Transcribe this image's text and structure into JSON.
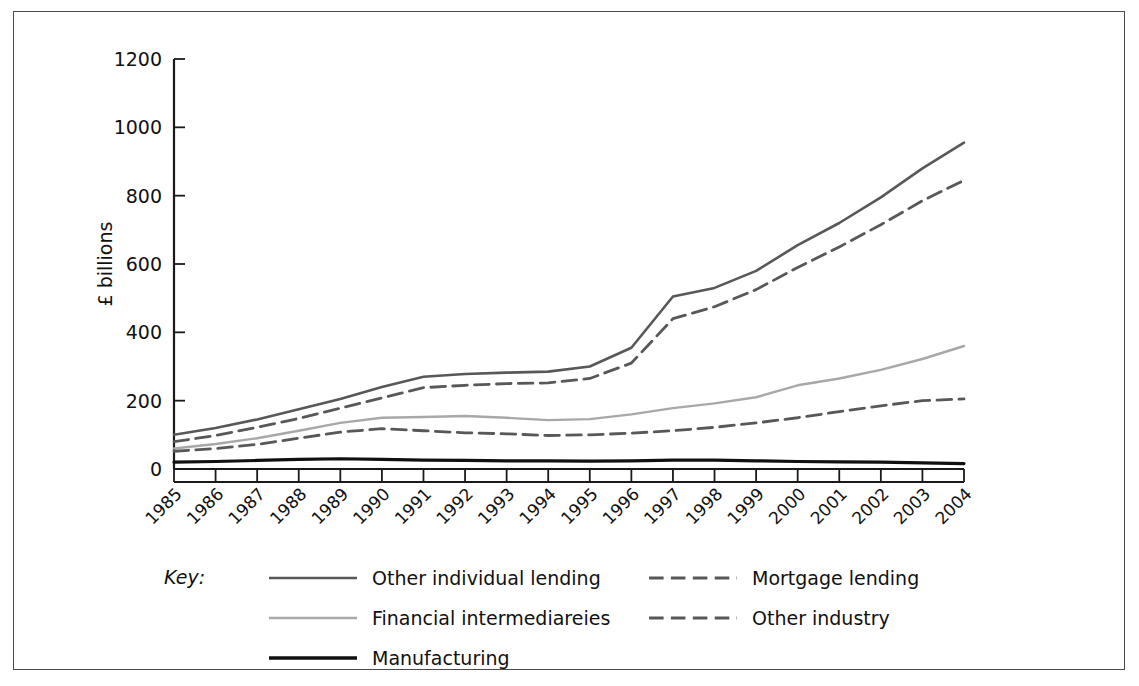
{
  "chart_data": {
    "type": "line",
    "title": "",
    "xlabel": "",
    "ylabel": "£ billions",
    "ylim": [
      0,
      1200
    ],
    "yticks": [
      0,
      200,
      400,
      600,
      800,
      1000,
      1200
    ],
    "ytick_labels": [
      "0",
      "200",
      "400",
      "600",
      "800",
      "1000",
      "1200"
    ],
    "grid": false,
    "legend_position": "below-axes",
    "legend_title": "Key:",
    "categories": [
      "1985",
      "1986",
      "1987",
      "1988",
      "1989",
      "1990",
      "1991",
      "1992",
      "1993",
      "1994",
      "1995",
      "1996",
      "1997",
      "1998",
      "1999",
      "2000",
      "2001",
      "2002",
      "2003",
      "2004"
    ],
    "series": [
      {
        "name": "Other individual lending",
        "color": "#585858",
        "style": "solid",
        "width": 2.6,
        "values": [
          100,
          120,
          145,
          175,
          205,
          240,
          270,
          278,
          282,
          285,
          300,
          355,
          505,
          530,
          580,
          655,
          720,
          795,
          880,
          955
        ]
      },
      {
        "name": "Mortgage lending",
        "color": "#585858",
        "style": "dashed",
        "width": 2.8,
        "values": [
          80,
          98,
          122,
          148,
          178,
          208,
          238,
          245,
          250,
          252,
          265,
          310,
          440,
          475,
          525,
          590,
          650,
          715,
          785,
          845
        ]
      },
      {
        "name": "Financial intermediareies",
        "color": "#a8a8a8",
        "style": "solid",
        "width": 2.4,
        "values": [
          60,
          73,
          90,
          112,
          135,
          150,
          152,
          155,
          150,
          143,
          146,
          160,
          178,
          192,
          210,
          245,
          265,
          290,
          322,
          360
        ]
      },
      {
        "name": "Other industry",
        "color": "#585858",
        "style": "dashed",
        "width": 2.8,
        "values": [
          52,
          60,
          72,
          90,
          108,
          118,
          112,
          106,
          103,
          98,
          100,
          105,
          112,
          122,
          135,
          150,
          168,
          185,
          200,
          205
        ]
      },
      {
        "name": "Manufacturing",
        "color": "#101010",
        "style": "solid",
        "width": 3.2,
        "values": [
          20,
          22,
          25,
          28,
          30,
          28,
          26,
          25,
          24,
          24,
          23,
          24,
          26,
          26,
          24,
          22,
          21,
          20,
          18,
          16
        ]
      }
    ]
  },
  "legend": {
    "key_label": "Key:",
    "column_left": [
      {
        "label": "Other individual lending",
        "color": "#585858",
        "style": "solid",
        "width": 2.6
      },
      {
        "label": "Financial intermediareies",
        "color": "#a8a8a8",
        "style": "solid",
        "width": 2.4
      },
      {
        "label": "Manufacturing",
        "color": "#101010",
        "style": "solid",
        "width": 3.4
      }
    ],
    "column_right": [
      {
        "label": "Mortgage lending",
        "color": "#585858",
        "style": "dashed",
        "width": 2.8
      },
      {
        "label": "Other industry",
        "color": "#585858",
        "style": "dashed",
        "width": 2.8
      }
    ]
  }
}
